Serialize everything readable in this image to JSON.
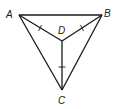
{
  "diagram": {
    "title": "",
    "points": {
      "A": {
        "label": "A",
        "x": 19,
        "y": 15
      },
      "B": {
        "label": "B",
        "x": 102,
        "y": 15
      },
      "C": {
        "label": "C",
        "x": 62,
        "y": 90
      },
      "D": {
        "label": "D",
        "x": 62,
        "y": 41
      }
    },
    "segments": [
      {
        "from": "A",
        "to": "B"
      },
      {
        "from": "B",
        "to": "C"
      },
      {
        "from": "C",
        "to": "A"
      },
      {
        "from": "A",
        "to": "D"
      },
      {
        "from": "B",
        "to": "D"
      },
      {
        "from": "D",
        "to": "C"
      }
    ],
    "congruence_marks": [
      {
        "segment": "AD",
        "ticks": 1
      },
      {
        "segment": "BD",
        "ticks": 1
      },
      {
        "segment": "DC",
        "ticks": 1
      }
    ],
    "colors": {
      "stroke": "#1a1a1a",
      "background": "#ffffff"
    }
  }
}
